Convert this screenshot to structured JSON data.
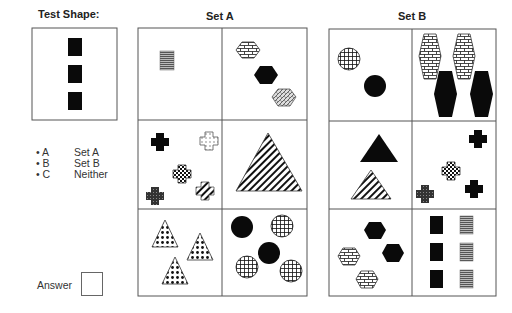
{
  "test_shape": {
    "title": "Test Shape:",
    "shapes": [
      {
        "type": "rect",
        "fill": "solid",
        "count": 3
      }
    ]
  },
  "legend": {
    "options": [
      {
        "key": "• A",
        "label": "Set A"
      },
      {
        "key": "• B",
        "label": "Set B"
      },
      {
        "key": "• C",
        "label": "Neither"
      }
    ]
  },
  "answer": {
    "label": "Answer",
    "value": ""
  },
  "set_a": {
    "title": "Set A",
    "cells": [
      {
        "description": "one small horizontal-striped gray rectangle"
      },
      {
        "description": "three hexagons: brick, solid black, woven"
      },
      {
        "description": "four crosses: solid, dotted outline, checkered, crosshatch, dark stipple"
      },
      {
        "description": "one large diagonally striped triangle"
      },
      {
        "description": "three checkered/dotted triangles"
      },
      {
        "description": "five circles: two solid black, three grid-patterned"
      }
    ]
  },
  "set_b": {
    "title": "Set B",
    "cells": [
      {
        "description": "two circles: one grid-patterned, one solid black"
      },
      {
        "description": "four elongated hexagons: two brick, two solid black"
      },
      {
        "description": "two triangles: solid black, diagonal striped"
      },
      {
        "description": "four crosses: two solid black, one checkered, one dark stipple"
      },
      {
        "description": "four hexagons: two solid black, two brick"
      },
      {
        "description": "six rectangles: three solid black, three horizontal-striped gray"
      }
    ]
  },
  "colors": {
    "border": "#555555",
    "solid": "#0a0a0a",
    "stripe_gray": "#777777"
  }
}
